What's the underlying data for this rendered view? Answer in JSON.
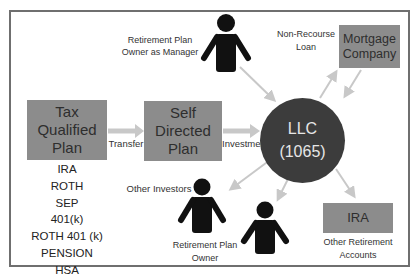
{
  "diagram": {
    "nodes": {
      "tax_plan": {
        "lines": [
          "Tax",
          "Qualified",
          "Plan"
        ]
      },
      "self_directed": {
        "lines": [
          "Self",
          "Directed",
          "Plan"
        ]
      },
      "llc": {
        "lines": [
          "LLC",
          "(1065)"
        ]
      },
      "mortgage": {
        "lines": [
          "Mortgage",
          "Company"
        ]
      },
      "ira": {
        "lines": [
          "IRA"
        ]
      }
    },
    "plan_types": [
      "IRA",
      "ROTH",
      "SEP",
      "401(k)",
      "ROTH 401 (k)",
      "PENSION",
      "HSA"
    ],
    "edge_labels": {
      "transfer": "Transfer",
      "investment": "Investment",
      "non_recourse_loan": [
        "Non-Recourse",
        "Loan"
      ]
    },
    "people": {
      "manager": {
        "label_lines": [
          "Retirement Plan",
          "Owner as Manager"
        ],
        "icon": "person-icon"
      },
      "other_investors": {
        "label": "Other Investors",
        "icon": "person-icon"
      },
      "plan_owner": {
        "label_lines": [
          "Retirement Plan",
          "Owner"
        ],
        "icon": "person-icon"
      }
    },
    "other_accounts_label": [
      "Other Retirement",
      "Accounts"
    ],
    "colors": {
      "box_fill": "#8c8c8c",
      "circle_fill": "#3c3c3c",
      "arrow": "#c8c8c8",
      "person": "#111111",
      "frame": "#6f6f6f"
    }
  }
}
